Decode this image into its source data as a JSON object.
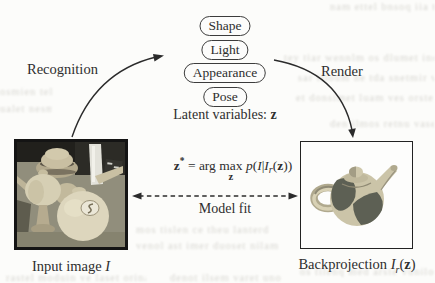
{
  "figure": {
    "latents": {
      "items": [
        "Shape",
        "Light",
        "Appearance",
        "Pose"
      ],
      "label_prefix": "Latent variables:",
      "label_var": "z"
    },
    "arrows": {
      "left_label": "Recognition",
      "right_label": "Render",
      "fit_label": "Model fit"
    },
    "equation": {
      "z": "z",
      "star": "*",
      "eq": "=",
      "arg": "arg",
      "max": "max",
      "sub_z": "z",
      "p": "p",
      "open1": "(",
      "I1": "I",
      "bar": "|",
      "I2": "I",
      "sub_r": "r",
      "open2": "(",
      "z2": "z",
      "close": "))"
    },
    "input": {
      "caption": "Input image",
      "caption_var": "I"
    },
    "backprojection": {
      "caption": "Backprojection",
      "var_I": "I",
      "var_sub": "r",
      "open": "(",
      "var_z": "z",
      "close": ")"
    }
  },
  "colors": {
    "ink": "#2e2e2e",
    "frame_dark": "#141414",
    "paper": "#fcfcfa",
    "teapot_tan": "#cbc4a8",
    "teapot_patch": "#5d6054",
    "photo_background": "#8f8c7a",
    "bleed_text": "#d7d6d1"
  },
  "bleed_lines": [
    "nam ettel bnsoq iia tcdam err",
    "tey tiar wennlm os dlumet ineq",
    "sar illoum ne tda snetmir vo",
    "et donsimet luam ves orsten bi",
    "osmien tel",
    "ualet nesm",
    "den ilmos retnu vaseq tilen",
    "mos tislen ce theu lanterd",
    "venol ast imer duoset nilam",
    "os tilenq med arste vunilo",
    "rastel moduin ve laset orinam tel",
    "denot ilsem varet uno"
  ]
}
